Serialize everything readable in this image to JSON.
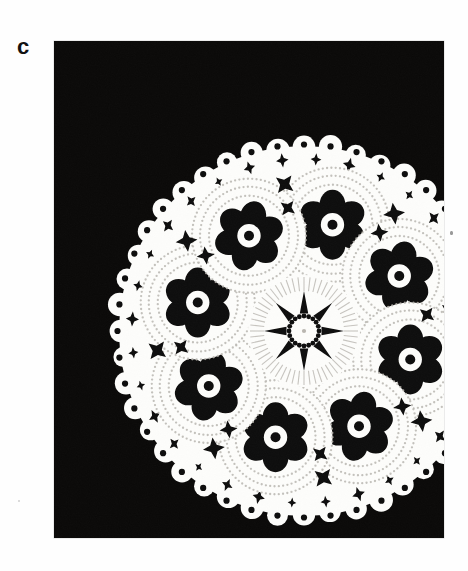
{
  "figure": {
    "panel_label": "c",
    "caption": "",
    "photo": {
      "background_color": "#0a0908",
      "lace_color": "#fdfdfb",
      "x": 54,
      "y": 41,
      "width": 390,
      "height": 497
    }
  },
  "doily": {
    "center_x": 250,
    "center_y": 290,
    "outer_radius": 195,
    "scallop_count": 44,
    "scallop_radius": 11,
    "medallion": {
      "count": 8,
      "orbit_radius": 110,
      "disc_radius": 57,
      "petal_count": 6,
      "petal_radius": 15,
      "petal_orbit": 20,
      "center_dot_radius": 5,
      "ring_radii": [
        57,
        49,
        40
      ],
      "start_angle_deg": -75
    },
    "center_motif": {
      "radius": 56,
      "spoke_count": 8,
      "inner_ring_radius": 15,
      "hub_radius": 6,
      "wedge_inner": 18,
      "wedge_outer": 40
    },
    "lattice": {
      "cell": 26,
      "star_radius": 10,
      "inner_radius": 3.6,
      "fill_radius": 150,
      "rotation_deg": 12
    },
    "colors": {
      "black": "#0a0908",
      "white": "#fdfdfb",
      "shadow": "#c9c7c2",
      "stitch": "#b9b6b0"
    }
  }
}
